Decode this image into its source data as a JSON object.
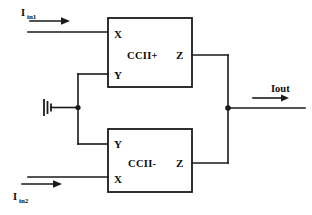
{
  "diagram": {
    "background_color": "#ffffff",
    "line_color": "#1a1a1a",
    "blocks": [
      {
        "id": "ccii-plus",
        "label": "CCII+",
        "ports": {
          "top_left": "X",
          "bottom_left": "Y",
          "right": "Z"
        }
      },
      {
        "id": "ccii-minus",
        "label": "CCII-",
        "ports": {
          "top_left": "Y",
          "bottom_left": "X",
          "right": "Z"
        }
      }
    ],
    "signals": {
      "input_top": {
        "symbol": "I",
        "subscript": "in1"
      },
      "input_bottom": {
        "symbol": "I",
        "subscript": "in2"
      },
      "output": {
        "symbol": "Iout",
        "subscript": ""
      }
    },
    "ground": {
      "name": "ground-symbol",
      "type": "vertical-bar-ground"
    }
  }
}
